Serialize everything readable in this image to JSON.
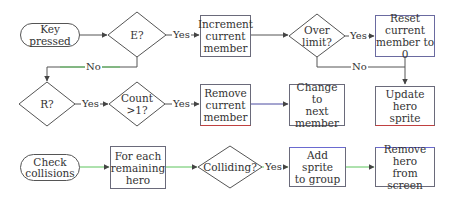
{
  "colors": {
    "line_default": "#555555",
    "line_green": "#5cc45c",
    "node_border": "#6a6a7a",
    "accent_red": "#c04040",
    "accent_blue": "#4a4aa0"
  },
  "flow1": {
    "start": "Key pressed",
    "decision_e": "E?",
    "increment": [
      "Increment",
      "current",
      "member"
    ],
    "decision_limit": [
      "Over",
      "limit?"
    ],
    "reset": [
      "Reset current",
      "member to 0"
    ],
    "update": [
      "Update hero",
      "sprite"
    ],
    "decision_r": "R?",
    "decision_count": [
      "Count",
      ">1?"
    ],
    "remove": [
      "Remove",
      "current",
      "member"
    ],
    "change": [
      "Change to",
      "next",
      "member"
    ]
  },
  "flow2": {
    "start": [
      "Check",
      "collisions"
    ],
    "for_each": [
      "For each",
      "remaining",
      "hero"
    ],
    "decision_colliding": "Colliding?",
    "add_sprite": [
      "Add sprite",
      "to group"
    ],
    "remove_hero": [
      "Remove hero",
      "from screen"
    ]
  },
  "edge_labels": {
    "e_yes": "Yes",
    "e_no": "No",
    "limit_yes": "Yes",
    "limit_no": "No",
    "r_yes": "Yes",
    "count_yes": "Yes",
    "colliding_yes": "Yes"
  }
}
